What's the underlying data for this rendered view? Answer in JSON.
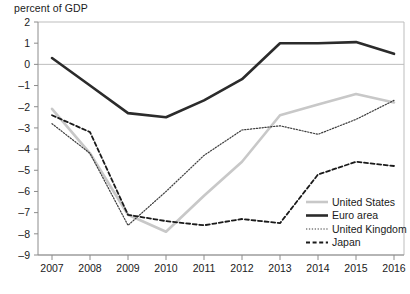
{
  "chart_data": {
    "type": "line",
    "title": "",
    "ylabel": "percent of GDP",
    "xlabel": "",
    "ylim": [
      -9,
      2
    ],
    "yticks": [
      2,
      1,
      0,
      -1,
      -2,
      -3,
      -4,
      -5,
      -6,
      -7,
      -8,
      -9
    ],
    "ytick_labels": [
      "2",
      "1",
      "0",
      "-1",
      "-2",
      "-3",
      "-4",
      "-5",
      "-6",
      "-7",
      "-8",
      "-9"
    ],
    "grid": "horizontal-gridlines-at-2-and-0-and--9",
    "legend_position": "bottom-right",
    "categories": [
      2007,
      2008,
      2009,
      2010,
      2011,
      2012,
      2013,
      2014,
      2015,
      2016
    ],
    "xtick_labels": [
      "2007",
      "2008",
      "2009",
      "2010",
      "2011",
      "2012",
      "2013",
      "2014",
      "2015",
      "2016"
    ],
    "series": [
      {
        "name": "United States",
        "style": "solid-thick",
        "color": "#c8c8c8",
        "values": [
          -2.1,
          -4.2,
          -7.1,
          -7.9,
          -6.2,
          -4.6,
          -2.4,
          -1.9,
          -1.4,
          -1.8
        ]
      },
      {
        "name": "Euro area",
        "style": "solid-thick",
        "color": "#2b2b2b",
        "values": [
          0.3,
          -1.0,
          -2.3,
          -2.5,
          -1.7,
          -0.7,
          1.0,
          1.0,
          1.05,
          0.5
        ]
      },
      {
        "name": "United Kingdom",
        "style": "dotted",
        "color": "#3d3d3d",
        "values": [
          -2.8,
          -4.2,
          -7.6,
          -6.0,
          -4.3,
          -3.1,
          -2.9,
          -3.3,
          -2.6,
          -1.7
        ]
      },
      {
        "name": "Japan",
        "style": "dashed",
        "color": "#1a1a1a",
        "values": [
          -2.4,
          -3.2,
          -7.1,
          -7.4,
          -7.6,
          -7.3,
          -7.5,
          -5.2,
          -4.6,
          -4.8
        ]
      }
    ]
  },
  "legend": {
    "items": [
      {
        "label": "United States"
      },
      {
        "label": "Euro area"
      },
      {
        "label": "United Kingdom"
      },
      {
        "label": "Japan"
      }
    ]
  }
}
